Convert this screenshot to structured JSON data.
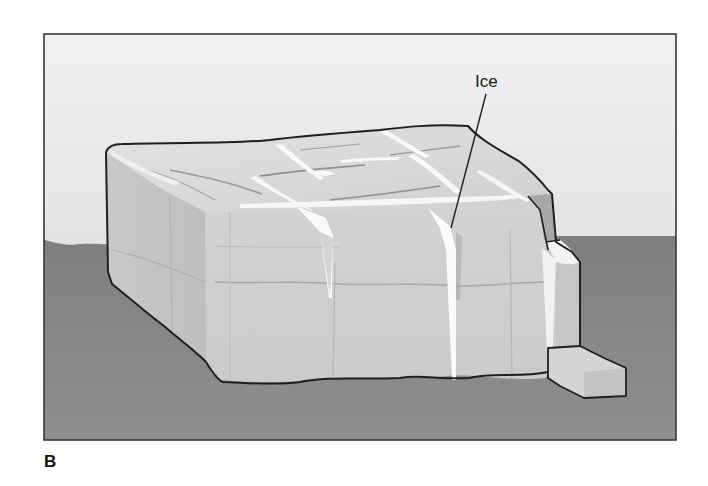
{
  "figure": {
    "panel_label": "B",
    "callouts": [
      {
        "label": "Ice",
        "target": "ice-filled crack on front face"
      }
    ]
  },
  "colors": {
    "sky_top": "#ececec",
    "sky_bottom": "#dcdcdc",
    "ground": "#8c8c8c",
    "rock_top": "#d6d6d6",
    "rock_front": "#cfcfcf",
    "rock_side": "#c2c2c2",
    "ice": "#f8f8f8",
    "outline": "#1f1f1f",
    "frame": "#3a3a3a"
  }
}
